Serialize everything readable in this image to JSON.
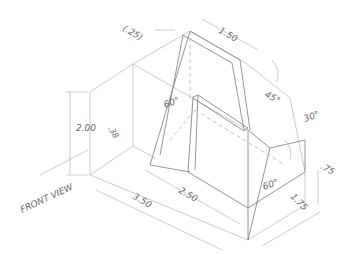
{
  "drawing": {
    "title": "Isometric view with dimensions",
    "view_label": "FRONT VIEW",
    "dimensions": {
      "top_offset": "(.25)",
      "top_width": "1.50",
      "height": "2.00",
      "small_height": ".38",
      "base_length": "3.50",
      "inner_length": "2.50",
      "right_depth": "1.75",
      "right_height": ".75"
    },
    "angles": {
      "left_incline": "60°",
      "top_incline": "45°",
      "right_upper": "30°",
      "right_lower": "60°"
    },
    "colors": {
      "line": "#7a7a7a",
      "hidden_line": "#b4b4b4",
      "text": "#666666",
      "background": "#ffffff"
    }
  }
}
